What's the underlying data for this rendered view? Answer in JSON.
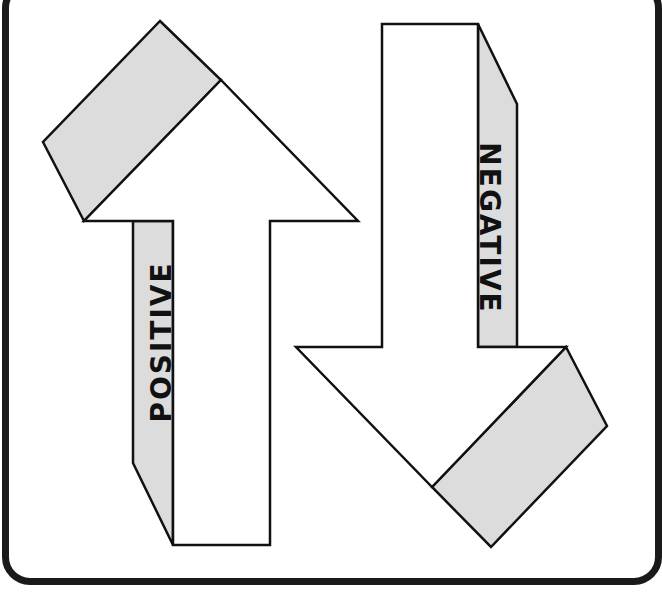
{
  "diagram": {
    "up_arrow": {
      "label": "POSITIVE",
      "direction": "up"
    },
    "down_arrow": {
      "label": "NEGATIVE",
      "direction": "down"
    },
    "colors": {
      "outline": "#111111",
      "shadow_fill": "#dcdcdc",
      "arrow_fill": "#ffffff",
      "frame": "#1a1a1a"
    }
  }
}
